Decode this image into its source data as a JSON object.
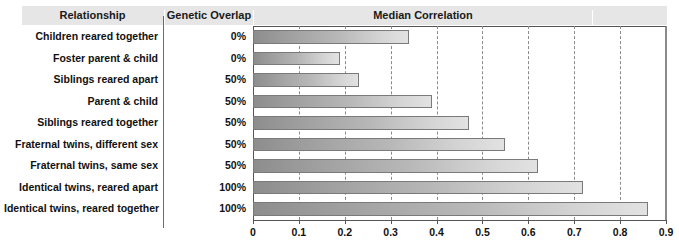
{
  "header": {
    "col_relationship": "Relationship",
    "col_genetic_overlap": "Genetic Overlap",
    "col_median_correlation": "Median Correlation"
  },
  "rows": [
    {
      "relationship": "Children reared together",
      "overlap": "0%",
      "correlation": 0.34
    },
    {
      "relationship": "Foster parent & child",
      "overlap": "0%",
      "correlation": 0.19
    },
    {
      "relationship": "Siblings reared apart",
      "overlap": "50%",
      "correlation": 0.23
    },
    {
      "relationship": "Parent & child",
      "overlap": "50%",
      "correlation": 0.39
    },
    {
      "relationship": "Siblings reared together",
      "overlap": "50%",
      "correlation": 0.47
    },
    {
      "relationship": "Fraternal twins, different sex",
      "overlap": "50%",
      "correlation": 0.55
    },
    {
      "relationship": "Fraternal twins, same sex",
      "overlap": "50%",
      "correlation": 0.62
    },
    {
      "relationship": "Identical twins, reared apart",
      "overlap": "100%",
      "correlation": 0.72
    },
    {
      "relationship": "Identical twins, reared together",
      "overlap": "100%",
      "correlation": 0.86
    }
  ],
  "axis": {
    "ticks": [
      "0",
      "0.1",
      "0.2",
      "0.3",
      "0.4",
      "0.5",
      "0.6",
      "0.7",
      "0.8",
      "0.9"
    ]
  },
  "colors": {
    "header_background": "#e6e6e6",
    "bar_dark": "#8d8d8d",
    "bar_light": "#e2e2e2",
    "bar_border": "#7a7a7a",
    "gridline": "#8a8a8a",
    "text": "#111111"
  },
  "chart_data": {
    "type": "bar",
    "title": "Median Correlation",
    "orientation": "horizontal",
    "xlabel": "",
    "ylabel": "",
    "xlim": [
      0,
      0.9
    ],
    "grid": true,
    "legend": "none",
    "categories": [
      "Children reared together",
      "Foster parent & child",
      "Siblings reared apart",
      "Parent & child",
      "Siblings reared together",
      "Fraternal twins, different sex",
      "Fraternal twins, same sex",
      "Identical twins, reared apart",
      "Identical twins, reared together"
    ],
    "values": [
      0.34,
      0.19,
      0.23,
      0.39,
      0.47,
      0.55,
      0.62,
      0.72,
      0.86
    ],
    "annotations": {
      "genetic_overlap": [
        "0%",
        "0%",
        "50%",
        "50%",
        "50%",
        "50%",
        "50%",
        "100%",
        "100%"
      ]
    },
    "xticks": [
      0,
      0.1,
      0.2,
      0.3,
      0.4,
      0.5,
      0.6,
      0.7,
      0.8,
      0.9
    ],
    "xticklabels": [
      "0",
      "0.1",
      "0.2",
      "0.3",
      "0.4",
      "0.5",
      "0.6",
      "0.7",
      "0.8",
      "0.9"
    ]
  }
}
